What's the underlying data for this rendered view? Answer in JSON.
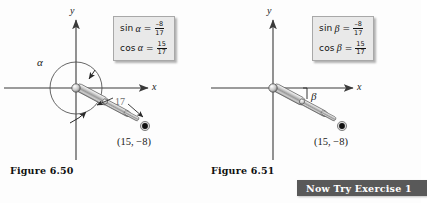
{
  "page": {
    "background_color": "#fdfdfd",
    "ink_color": "#1a1a1a"
  },
  "figures": [
    {
      "id": "figure-6-50",
      "caption": "Figure 6.50",
      "angle_symbol": "α",
      "axis_x_label": "x",
      "axis_y_label": "y",
      "point_label": "(15, −8)",
      "length_label": "17",
      "formulas": [
        {
          "function": "sin",
          "variable": "α",
          "equals": "=",
          "numerator": "–8",
          "denominator": "17"
        },
        {
          "function": "cos",
          "variable": "α",
          "equals": "=",
          "numerator": "15",
          "denominator": "17"
        }
      ],
      "rotation_style": "full-circle-beyond-360"
    },
    {
      "id": "figure-6-51",
      "caption": "Figure 6.51",
      "angle_symbol": "β",
      "axis_x_label": "x",
      "axis_y_label": "y",
      "point_label": "(15, −8)",
      "length_label": "",
      "formulas": [
        {
          "function": "sin",
          "variable": "β",
          "equals": "=",
          "numerator": "–8",
          "denominator": "17"
        },
        {
          "function": "cos",
          "variable": "β",
          "equals": "=",
          "numerator": "15",
          "denominator": "17"
        }
      ],
      "rotation_style": "small-negative-angle"
    }
  ],
  "banner": {
    "label": "Now Try Exercise 1",
    "background_color": "#595959",
    "text_color": "#ffffff"
  },
  "callout": {
    "background_color": "#e9e9e9",
    "border_color": "#a8a8a8"
  }
}
